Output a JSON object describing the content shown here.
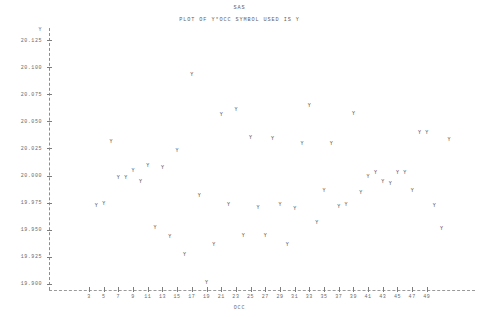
{
  "header": {
    "title": "SAS",
    "subtitle": "PLOT OF Y*OCC   SYMBOL USED IS Y"
  },
  "colors": {
    "text": "#6b6b6b",
    "point": "#4d4d4d",
    "axis": "#8d8d8d",
    "background": "#ffffff"
  },
  "chart_data": {
    "type": "scatter",
    "title": "SAS",
    "subtitle": "PLOT OF Y*OCC   SYMBOL USED IS Y",
    "symbol": "Y",
    "xlabel": "OCC",
    "ylabel": "Y",
    "xlim": [
      2,
      51
    ],
    "ylim": [
      19.9,
      20.125
    ],
    "grid": false,
    "legend": "none",
    "xticks": [
      3,
      5,
      7,
      9,
      11,
      13,
      15,
      17,
      19,
      21,
      23,
      25,
      27,
      29,
      31,
      33,
      35,
      37,
      39,
      41,
      43,
      45,
      47,
      49
    ],
    "yticks": [
      "20.125",
      "20.100",
      "20.075",
      "20.050",
      "20.025",
      "20.000",
      "19.975",
      "19.950",
      "19.925",
      "19.900"
    ],
    "points": [
      {
        "x": 4,
        "y": 19.9715
      },
      {
        "x": 5,
        "y": 19.974
      },
      {
        "x": 6,
        "y": 20.0305
      },
      {
        "x": 7,
        "y": 19.9975
      },
      {
        "x": 8,
        "y": 19.9975
      },
      {
        "x": 9,
        "y": 20.0045
      },
      {
        "x": 10,
        "y": 19.994
      },
      {
        "x": 11,
        "y": 20.009
      },
      {
        "x": 12,
        "y": 19.952
      },
      {
        "x": 13,
        "y": 20.0065
      },
      {
        "x": 14,
        "y": 19.943
      },
      {
        "x": 15,
        "y": 20.023
      },
      {
        "x": 16,
        "y": 19.927
      },
      {
        "x": 17,
        "y": 20.093
      },
      {
        "x": 18,
        "y": 19.981
      },
      {
        "x": 19,
        "y": 19.901
      },
      {
        "x": 20,
        "y": 19.9355
      },
      {
        "x": 21,
        "y": 20.0555
      },
      {
        "x": 22,
        "y": 19.9725
      },
      {
        "x": 23,
        "y": 20.06
      },
      {
        "x": 24,
        "y": 19.9445
      },
      {
        "x": 25,
        "y": 20.0345
      },
      {
        "x": 26,
        "y": 19.97
      },
      {
        "x": 27,
        "y": 19.9445
      },
      {
        "x": 28,
        "y": 20.034
      },
      {
        "x": 29,
        "y": 19.973
      },
      {
        "x": 30,
        "y": 19.9355
      },
      {
        "x": 31,
        "y": 19.969
      },
      {
        "x": 32,
        "y": 20.0295
      },
      {
        "x": 33,
        "y": 20.064
      },
      {
        "x": 34,
        "y": 19.956
      },
      {
        "x": 35,
        "y": 19.986
      },
      {
        "x": 36,
        "y": 20.0295
      },
      {
        "x": 37,
        "y": 19.9705
      },
      {
        "x": 38,
        "y": 19.9725
      },
      {
        "x": 39,
        "y": 20.057
      },
      {
        "x": 40,
        "y": 19.984
      },
      {
        "x": 41,
        "y": 19.999
      },
      {
        "x": 42,
        "y": 20.002
      },
      {
        "x": 43,
        "y": 19.994
      },
      {
        "x": 44,
        "y": 19.992
      },
      {
        "x": 45,
        "y": 20.0025
      },
      {
        "x": 46,
        "y": 20.0025
      },
      {
        "x": 47,
        "y": 19.9855
      },
      {
        "x": 48,
        "y": 20.0395
      },
      {
        "x": 49,
        "y": 20.0395
      },
      {
        "x": 50,
        "y": 19.9715
      },
      {
        "x": 51,
        "y": 19.951
      },
      {
        "x": 52,
        "y": 20.033
      }
    ]
  }
}
